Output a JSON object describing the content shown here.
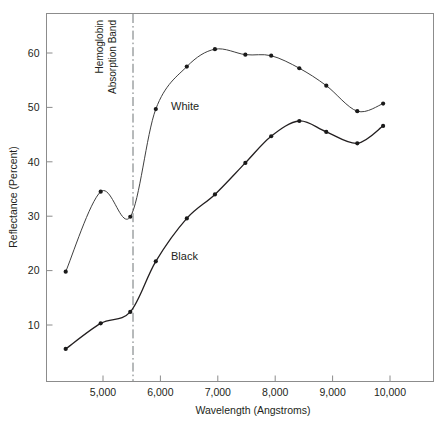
{
  "chart_data": {
    "type": "line",
    "title": "",
    "subtitle": "",
    "xlabel": "Wavelength (Angstroms)",
    "ylabel": "Reflectance (Percent)",
    "xlim": [
      4100,
      10450
    ],
    "ylim": [
      2,
      69
    ],
    "grid": false,
    "legend": "inline-labels",
    "x_ticks": [
      5000,
      6000,
      7000,
      8000,
      9000,
      10000
    ],
    "x_tick_labels": [
      "5,000",
      "6,000",
      "7,000",
      "8,000",
      "9,000",
      "10,000"
    ],
    "y_ticks": [
      10,
      20,
      30,
      40,
      50,
      60
    ],
    "y_tick_labels": [
      "10",
      "20",
      "30",
      "40",
      "50",
      "60"
    ],
    "annotations": [
      {
        "name": "hemoglobin-absorption-band",
        "lines": [
          "Hemoglobin",
          "Absorption Band"
        ],
        "type": "vertical-dash-dot-line",
        "x": 5475
      }
    ],
    "series": [
      {
        "name": "White",
        "label": "White",
        "color": "#3f3f3f",
        "marker": "filled-circle",
        "x": [
          4350,
          4960,
          5475,
          5920,
          6460,
          6950,
          7480,
          7930,
          8420,
          8890,
          9430,
          9880
        ],
        "values": [
          19.8,
          34.5,
          29.9,
          49.7,
          57.5,
          60.7,
          59.7,
          59.5,
          57.2,
          54.0,
          49.3,
          50.7
        ]
      },
      {
        "name": "Black",
        "label": "Black",
        "color": "#231f20",
        "marker": "filled-circle",
        "x": [
          4350,
          4960,
          5475,
          5920,
          6460,
          6950,
          7480,
          7930,
          8420,
          8890,
          9430,
          9880
        ],
        "values": [
          5.6,
          10.3,
          12.4,
          21.7,
          29.6,
          34.0,
          39.8,
          44.7,
          47.5,
          45.5,
          43.4,
          46.6
        ]
      }
    ]
  },
  "axes": {
    "y_title": "Reflectance (Percent)",
    "x_title": "Wavelength (Angstroms)"
  },
  "labels": {
    "white": "White",
    "black": "Black",
    "band_line1": "Hemoglobin",
    "band_line2": "Absorption Band"
  },
  "colors": {
    "frame": "#8c8c8c",
    "white_series": "#3f3f3f",
    "black_series": "#231f20",
    "band_line": "#6f7476",
    "text": "#231f20",
    "background": "#ffffff"
  }
}
